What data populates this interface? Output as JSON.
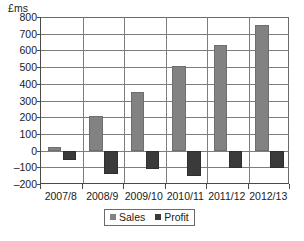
{
  "chart_data": {
    "type": "bar",
    "title": "",
    "subtitle": "",
    "xlabel": "",
    "ylabel": "£ms",
    "ylim": [
      -200,
      800
    ],
    "ytick_step": 100,
    "yticks": [
      "800",
      "700",
      "600",
      "500",
      "400",
      "300",
      "200",
      "100",
      "0",
      "-100",
      "-200"
    ],
    "grid": true,
    "legend_position": "bottom-center",
    "categories": [
      "2007/8",
      "2008/9",
      "2009/10",
      "2010/11",
      "2011/12",
      "2012/13"
    ],
    "series": [
      {
        "name": "Sales",
        "color": "#828282",
        "values": [
          20,
          205,
          350,
          505,
          630,
          755
        ]
      },
      {
        "name": "Profit",
        "color": "#3a3a3a",
        "values": [
          -55,
          -140,
          -110,
          -150,
          -105,
          -105
        ]
      }
    ]
  },
  "legend": {
    "items": [
      {
        "label": "Sales"
      },
      {
        "label": "Profit"
      }
    ]
  },
  "colors": {
    "sales": "#828282",
    "profit": "#3a3a3a",
    "axis": "#4a4a4a",
    "grid": "#7d7d7d",
    "background": "#ffffff"
  }
}
